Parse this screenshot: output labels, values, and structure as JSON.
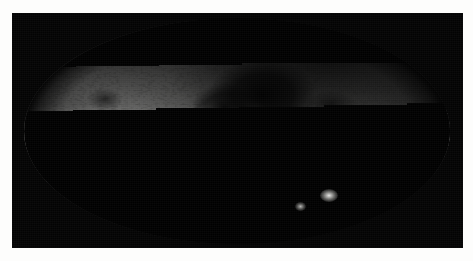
{
  "figure": {
    "kind": "all-sky-map",
    "projection": "Mollweide (equal-area all-sky)",
    "coordinate_system": "Galactic",
    "caption": "",
    "plate_background_color": "#030303",
    "page_background_color": "#ffffff",
    "star_color": "#ffffff"
  },
  "chart_data": {
    "type": "heatmap",
    "title": "",
    "subtitle": "",
    "xlabel": "",
    "ylabel": "",
    "projection": "mollweide",
    "grid": false,
    "legend": "none",
    "colormap": "grayscale",
    "value_meaning": "integrated stellar surface density / sky brightness",
    "xlim": [
      180,
      -180
    ],
    "ylim": [
      -90,
      90
    ],
    "x_tick_labels": [],
    "y_tick_labels": [],
    "features": [
      {
        "name": "galactic-plane-band",
        "galactic_l_deg": 0,
        "galactic_b_deg": 0,
        "brightness": 1.0,
        "description": "Bright continuous horizontal band of the Milky Way disc spanning the full width of the oval"
      },
      {
        "name": "galactic-bulge",
        "galactic_l_deg": 0,
        "galactic_b_deg": 0,
        "brightness": 1.0,
        "description": "Brightest concentrated knot at the centre of the map"
      },
      {
        "name": "great-rift-dust-lane",
        "galactic_l_deg": 25,
        "galactic_b_deg": 8,
        "brightness": 0.05,
        "description": "Large dark dust lane above and left of the bulge"
      },
      {
        "name": "aquila-rift",
        "galactic_l_deg": 35,
        "galactic_b_deg": 4,
        "brightness": 0.08,
        "description": "Dark extinction cloud adjoining the rift"
      },
      {
        "name": "large-magellanic-cloud",
        "galactic_l_deg": 280,
        "galactic_b_deg": -33,
        "brightness": 0.85,
        "description": "Bright compact blob in the lower-right quadrant"
      },
      {
        "name": "small-magellanic-cloud",
        "galactic_l_deg": 303,
        "galactic_b_deg": -44,
        "brightness": 0.65,
        "description": "Smaller fainter blob below-left of the LMC"
      },
      {
        "name": "north-polar-dark-region",
        "galactic_l_deg": 330,
        "galactic_b_deg": 55,
        "brightness": 0.12,
        "description": "Low star-density wedge in the upper-right quadrant"
      },
      {
        "name": "south-galactic-halo",
        "galactic_l_deg": 90,
        "galactic_b_deg": -60,
        "brightness": 0.2,
        "description": "Dim speckled halo filling the lower half of the oval"
      },
      {
        "name": "anticentre-glow",
        "galactic_l_deg": 180,
        "galactic_b_deg": 0,
        "brightness": 0.7,
        "description": "Moderately bright disc emission at the left and right oval edges"
      }
    ]
  }
}
